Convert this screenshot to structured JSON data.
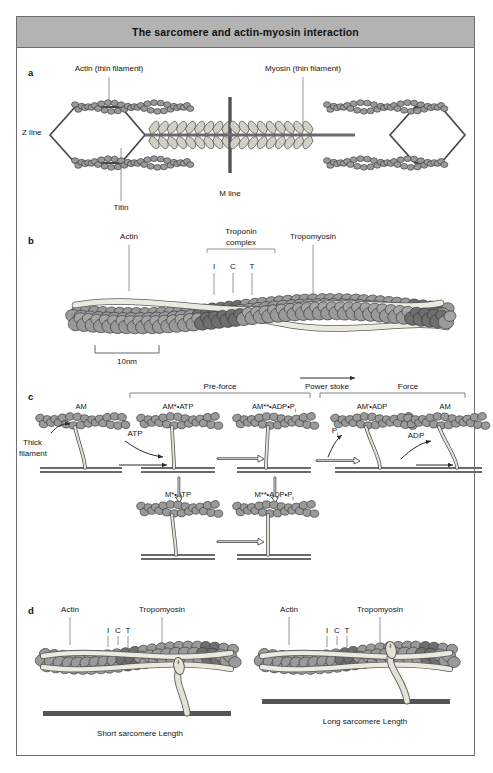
{
  "figure": {
    "title": "The sarcomere and actin-myosin interaction",
    "border_color": "#6e6e72",
    "header_color": "#b3b3b3"
  },
  "colors": {
    "bead_fill": "#9a9a9a",
    "bead_dark_fill": "#6f6f6f",
    "bead_stroke": "#3a3a3a",
    "filament_fill": "#e9e6dc",
    "filament_stroke": "#5a5a5a",
    "rod": "#6a6a6a",
    "dark_bar": "#545458",
    "leader": "#7a7a7a",
    "text": "#141414"
  },
  "panels": {
    "a": {
      "letter": "a",
      "labels": {
        "actin": "Actin (thin filament)",
        "myosin": "Myosin (thin filament)",
        "z_line": "Z line",
        "m_line": "M line",
        "titin": "Titin"
      }
    },
    "b": {
      "letter": "b",
      "labels": {
        "actin": "Actin",
        "troponin_line1": "Troponin",
        "troponin_line2": "complex",
        "tropomyosin": "Tropomyosin",
        "subunit_i": "I",
        "subunit_c": "C",
        "subunit_t": "T",
        "scale": "10nm"
      }
    },
    "c": {
      "letter": "c",
      "phases": {
        "pre_force": "Pre-force",
        "power_stroke": "Power stoke",
        "force": "Force"
      },
      "labels": {
        "thick_filament_line1": "Thick",
        "thick_filament_line2": "filament"
      },
      "top_states": [
        {
          "name": "AM",
          "stars": 0
        },
        {
          "name": "AM*•ATP",
          "stars": 1
        },
        {
          "name": "AM**•ADP•P",
          "subscript": "i"
        },
        {
          "name": "AM'•ADP",
          "stars": 0
        },
        {
          "name": "AM",
          "stars": 0
        }
      ],
      "bottom_states": [
        {
          "name": "M*•ATP"
        },
        {
          "name": "M**•ADP•P",
          "subscript": "i"
        }
      ],
      "reaction_labels": {
        "atp": "ATP",
        "pi": "P",
        "pi_subscript": "i",
        "adp": "ADP"
      }
    },
    "d": {
      "letter": "d",
      "left": {
        "actin": "Actin",
        "tropomyosin": "Tropomyosin",
        "subunit_i": "I",
        "subunit_c": "C",
        "subunit_t": "T",
        "caption": "Short sarcomere Length"
      },
      "right": {
        "actin": "Actin",
        "tropomyosin": "Tropomyosin",
        "subunit_i": "I",
        "subunit_c": "C",
        "subunit_t": "T",
        "caption": "Long sarcomere Length"
      }
    }
  }
}
